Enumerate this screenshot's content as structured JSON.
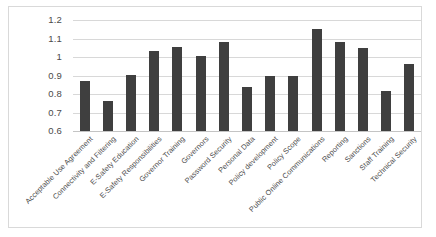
{
  "chart_data": {
    "type": "bar",
    "title": "",
    "xlabel": "",
    "ylabel": "",
    "ylim": [
      0.6,
      1.2
    ],
    "yticks": [
      "0.6",
      "0.7",
      "0.8",
      "0.9",
      "1",
      "1.1",
      "1.2"
    ],
    "ytick_values": [
      0.6,
      0.7,
      0.8,
      0.9,
      1.0,
      1.1,
      1.2
    ],
    "grid": true,
    "legend": false,
    "bar_color": "#3f3f3f",
    "categories": [
      "Acceptable Use Agreement",
      "Connectivity and Filtering",
      "E-Safety Education",
      "E-Safety Responsibilities",
      "Governor Training",
      "Governors",
      "Password Security",
      "Personal Data",
      "Policy development",
      "Policy Scope",
      "Public Online Communications",
      "Reporting",
      "Sanctions",
      "Staff Training",
      "Technical Security"
    ],
    "values": [
      0.87,
      0.76,
      0.905,
      1.035,
      1.055,
      1.005,
      1.08,
      0.84,
      0.895,
      0.9,
      1.15,
      1.08,
      1.05,
      0.815,
      0.96
    ]
  }
}
